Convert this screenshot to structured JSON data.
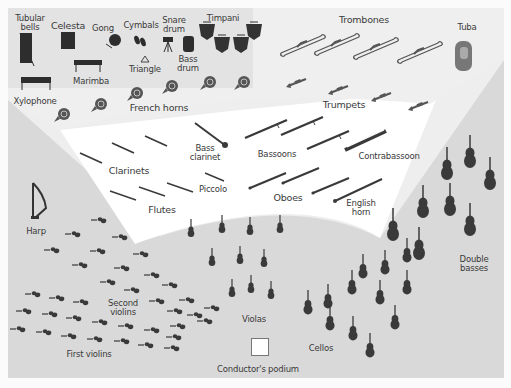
{
  "diagram": {
    "colors": {
      "background": "#fbfbfb",
      "percussion_zone": "#e2e2e2",
      "brass_zone": "#ededed",
      "woodwind_zone": "#ffffff",
      "strings_zone": "#d6d6d6",
      "instrument_fill": "#3a3a3a",
      "label_text": "#3a3a3a"
    },
    "labels": {
      "tubular_bells": "Tubular\nbells",
      "celesta": "Celesta",
      "gong": "Gong",
      "cymbals": "Cymbals",
      "snare_drum": "Snare\ndrum",
      "timpani": "Timpani",
      "triangle": "Triangle",
      "bass_drum": "Bass\ndrum",
      "marimba": "Marimba",
      "xylophone": "Xylophone",
      "french_horns": "French horns",
      "trombones": "Trombones",
      "tuba": "Tuba",
      "trumpets": "Trumpets",
      "bass_clarinet": "Bass\nclarinet",
      "bassoons": "Bassoons",
      "contrabassoon": "Contrabassoon",
      "clarinets": "Clarinets",
      "piccolo": "Piccolo",
      "flutes": "Flutes",
      "oboes": "Oboes",
      "english_horn": "English\nhorn",
      "harp": "Harp",
      "double_basses": "Double\nbasses",
      "second_violins": "Second\nviolins",
      "violas": "Violas",
      "first_violins": "First violins",
      "cellos": "Cellos",
      "conductors_podium": "Conductor's podium"
    },
    "sections": [
      {
        "name": "Percussion",
        "instruments": [
          "Tubular bells",
          "Celesta",
          "Gong",
          "Cymbals",
          "Snare drum",
          "Timpani",
          "Triangle",
          "Bass drum",
          "Marimba",
          "Xylophone"
        ],
        "timpani_count": 4
      },
      {
        "name": "Brass",
        "instruments": [
          "French horns",
          "Trombones",
          "Tuba",
          "Trumpets"
        ],
        "counts": {
          "french_horns": 6,
          "trombones": 4,
          "tuba": 1,
          "trumpets": 4
        }
      },
      {
        "name": "Woodwinds",
        "instruments": [
          "Bass clarinet",
          "Bassoons",
          "Contrabassoon",
          "Clarinets",
          "Piccolo",
          "Flutes",
          "Oboes",
          "English horn"
        ],
        "counts": {
          "bass_clarinet": 1,
          "bassoons": 3,
          "contrabassoon": 1,
          "clarinets": 3,
          "piccolo": 1,
          "flutes": 3,
          "oboes": 3,
          "english_horn": 1
        }
      },
      {
        "name": "Strings",
        "instruments": [
          "Harp",
          "First violins",
          "Second violins",
          "Violas",
          "Cellos",
          "Double basses"
        ],
        "counts": {
          "harp": 1,
          "double_basses": 8
        }
      }
    ]
  }
}
